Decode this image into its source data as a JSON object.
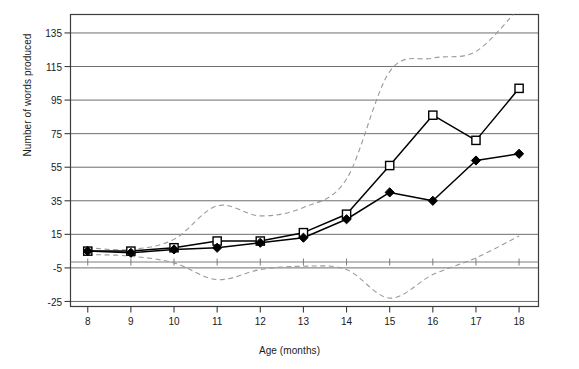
{
  "chart_data": {
    "type": "line",
    "title": "",
    "xlabel": "Age (months)",
    "ylabel": "Number of words produced",
    "x": [
      8,
      9,
      10,
      11,
      12,
      13,
      14,
      15,
      16,
      17,
      18
    ],
    "xtick_labels": [
      "8",
      "9",
      "10",
      "11",
      "12",
      "13",
      "14",
      "15",
      "16",
      "17",
      "18"
    ],
    "ytick_labels": [
      "-25",
      "-5",
      "15",
      "35",
      "55",
      "75",
      "95",
      "115",
      "135"
    ],
    "ytick_values": [
      -25,
      -5,
      15,
      35,
      55,
      75,
      95,
      115,
      135
    ],
    "xlim": [
      7.6,
      18.45
    ],
    "ylim": [
      -28,
      146
    ],
    "grid": "horizontal",
    "legend_position": "none",
    "series": [
      {
        "name": "Open square series",
        "marker": "open-square",
        "line_style": "solid",
        "color": "#000000",
        "values": [
          5,
          5,
          7,
          11,
          11,
          16,
          27,
          56,
          86,
          71,
          102
        ]
      },
      {
        "name": "Filled diamond series",
        "marker": "filled-diamond",
        "line_style": "solid",
        "color": "#000000",
        "values": [
          5,
          4,
          6,
          7,
          10,
          13,
          24,
          40,
          35,
          59,
          63
        ]
      },
      {
        "name": "Upper confidence band",
        "marker": "none",
        "line_style": "dashed",
        "color": "#808080",
        "values": [
          7,
          6,
          12,
          32,
          26,
          31,
          48,
          112,
          120,
          124,
          150
        ]
      },
      {
        "name": "Lower confidence band",
        "marker": "none",
        "line_style": "dashed",
        "color": "#808080",
        "values": [
          3,
          2,
          -2,
          -12,
          -6,
          -4,
          -6,
          -23,
          -9,
          1,
          14
        ]
      }
    ],
    "annotations": []
  },
  "colors": {
    "frame": "#3c3c3c",
    "gridline": "#6e6e6e",
    "data_line": "#000000",
    "band_line": "#9a9a9a",
    "text": "#1a1a1a",
    "background": "#ffffff"
  }
}
